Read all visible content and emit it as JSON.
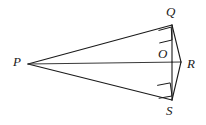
{
  "figure": {
    "type": "geometry-diagram",
    "background_color": "#ffffff",
    "stroke_color": "#1a1a1a",
    "label_color": "#1a1a1a",
    "points": [
      {
        "id": "P",
        "label": "P",
        "x": 28,
        "y": 64,
        "label_x": 13,
        "label_y": 56
      },
      {
        "id": "Q",
        "label": "Q",
        "x": 172,
        "y": 25,
        "label_x": 166,
        "label_y": 5
      },
      {
        "id": "O",
        "label": "O",
        "x": 172,
        "y": 62,
        "label_x": 158,
        "label_y": 47
      },
      {
        "id": "R",
        "label": "R",
        "x": 181,
        "y": 62,
        "label_x": 187,
        "label_y": 58
      },
      {
        "id": "S",
        "label": "S",
        "x": 172,
        "y": 100,
        "label_x": 166,
        "label_y": 104
      }
    ],
    "segments": [
      {
        "id": "PQ",
        "from": "P",
        "to": "Q",
        "weight": "thin"
      },
      {
        "id": "PS",
        "from": "P",
        "to": "S",
        "weight": "thin"
      },
      {
        "id": "PR",
        "from": "P",
        "to": "R",
        "weight": "thin"
      },
      {
        "id": "QO",
        "from": "Q",
        "to": "O",
        "weight": "thin"
      },
      {
        "id": "OS",
        "from": "O",
        "to": "S",
        "weight": "thin"
      },
      {
        "id": "QR",
        "from": "Q",
        "to": "R",
        "weight": "thin"
      },
      {
        "id": "RS",
        "from": "R",
        "to": "S",
        "weight": "thin"
      }
    ],
    "right_angle_marks": [
      {
        "id": "right-angle-at-Q",
        "at": "Q",
        "x": 158,
        "y": 27,
        "size": 13
      },
      {
        "id": "right-angle-at-S",
        "at": "S",
        "x": 157,
        "y": 85,
        "size": 13
      }
    ]
  }
}
